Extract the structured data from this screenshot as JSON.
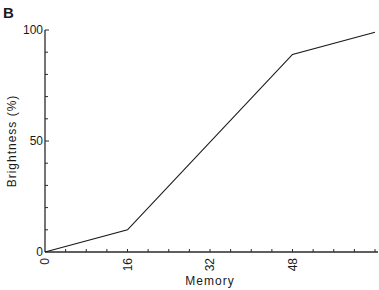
{
  "panel_label": "B",
  "chart_data": {
    "type": "line",
    "title": "",
    "xlabel": "Memory",
    "ylabel": "Brightness (%)",
    "xlim": [
      0,
      64
    ],
    "ylim": [
      0,
      100
    ],
    "x_ticks": [
      0,
      16,
      32,
      48
    ],
    "x_tick_labels": [
      "0",
      "16",
      "32",
      "48"
    ],
    "x_minor_step": 4,
    "y_ticks": [
      0,
      50,
      100
    ],
    "y_tick_labels": [
      "0",
      "50",
      "100"
    ],
    "y_minor_step": 10,
    "grid": false,
    "legend": null,
    "series": [
      {
        "name": "Brightness",
        "x": [
          0,
          16,
          48,
          64
        ],
        "y": [
          0,
          10,
          89,
          99
        ],
        "color": "#1a1a1a"
      }
    ]
  }
}
